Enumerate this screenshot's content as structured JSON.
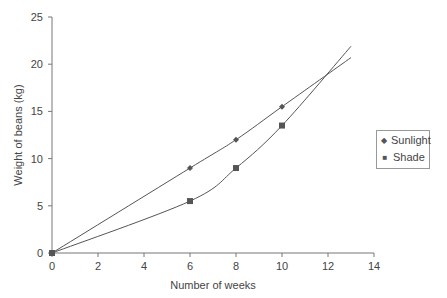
{
  "chart_data": {
    "type": "line",
    "title": "",
    "xlabel": "Number of weeks",
    "ylabel": "Weight of beans (kg)",
    "xlim": [
      0,
      14
    ],
    "ylim": [
      0,
      25
    ],
    "x_ticks": [
      0,
      2,
      4,
      6,
      8,
      10,
      12,
      14
    ],
    "y_ticks": [
      0,
      5,
      10,
      15,
      20,
      25
    ],
    "grid": false,
    "legend_position": "right",
    "series": [
      {
        "name": "Sunlight",
        "marker": "diamond",
        "points": [
          [
            0,
            0
          ],
          [
            6,
            9
          ],
          [
            8,
            12
          ],
          [
            10,
            15.5
          ]
        ],
        "trend_end": [
          13,
          20.7
        ]
      },
      {
        "name": "Shade",
        "marker": "square",
        "points": [
          [
            0,
            0
          ],
          [
            6,
            5.5
          ],
          [
            8,
            9
          ],
          [
            10,
            13.5
          ]
        ],
        "trend_end": [
          13,
          21.9
        ]
      }
    ]
  },
  "legend": {
    "items": [
      {
        "label": "Sunlight",
        "marker": "◆"
      },
      {
        "label": "Shade",
        "marker": "■"
      }
    ]
  }
}
